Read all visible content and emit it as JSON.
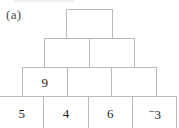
{
  "figure": {
    "part_label": "(a)",
    "type": "number-pyramid",
    "colors": {
      "cell_border": "#b9b9b9",
      "cell_background": "#ffffff",
      "text": "#1c1c1c",
      "label_text": "#4a4a4a",
      "page_background": "#ffffff"
    },
    "rows": [
      {
        "row_index": 1,
        "position": "top",
        "cells": [
          {
            "value": "",
            "filled": false
          }
        ]
      },
      {
        "row_index": 2,
        "position": "second",
        "cells": [
          {
            "value": "",
            "filled": false
          },
          {
            "value": "",
            "filled": false
          }
        ]
      },
      {
        "row_index": 3,
        "position": "third",
        "cells": [
          {
            "value": "9",
            "filled": true
          },
          {
            "value": "",
            "filled": false
          },
          {
            "value": "",
            "filled": false
          }
        ]
      },
      {
        "row_index": 4,
        "position": "bottom",
        "cells": [
          {
            "value": "5",
            "filled": true
          },
          {
            "value": "4",
            "filled": true
          },
          {
            "value": "6",
            "filled": true
          },
          {
            "value": "3",
            "filled": true,
            "sign": "−",
            "sign_style": "raised"
          }
        ]
      }
    ]
  }
}
